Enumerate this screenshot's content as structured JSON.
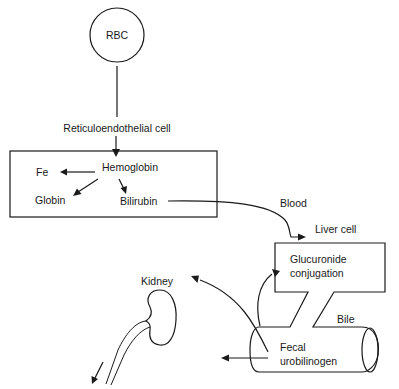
{
  "diagram": {
    "type": "flowchart",
    "nodes": {
      "rbc": "RBC",
      "reticuloendothelial_cell": "Reticuloendothelial cell",
      "hemoglobin": "Hemoglobin",
      "fe": "Fe",
      "globin": "Globin",
      "bilirubin": "Bilirubin",
      "blood": "Blood",
      "liver_cell": "Liver cell",
      "glucuronide_line1": "Glucuronide",
      "glucuronide_line2": "conjugation",
      "kidney": "Kidney",
      "bile": "Bile",
      "fecal_line1": "Fecal",
      "fecal_line2": "urobilinogen"
    },
    "edges": [
      {
        "from": "RBC",
        "to": "Hemoglobin",
        "via": "Reticuloendothelial cell"
      },
      {
        "from": "Hemoglobin",
        "to": "Fe"
      },
      {
        "from": "Hemoglobin",
        "to": "Globin"
      },
      {
        "from": "Hemoglobin",
        "to": "Bilirubin"
      },
      {
        "from": "Bilirubin",
        "to": "Liver cell",
        "via": "Blood"
      },
      {
        "from": "Glucuronide conjugation",
        "to": "Fecal urobilinogen",
        "via": "Bile"
      },
      {
        "from": "Fecal urobilinogen",
        "to": "Glucuronide conjugation"
      },
      {
        "from": "Fecal urobilinogen",
        "to": "Kidney"
      },
      {
        "from": "Fecal urobilinogen",
        "to": "excretion (feces)"
      },
      {
        "from": "Kidney",
        "to": "excretion (urine)"
      }
    ]
  }
}
